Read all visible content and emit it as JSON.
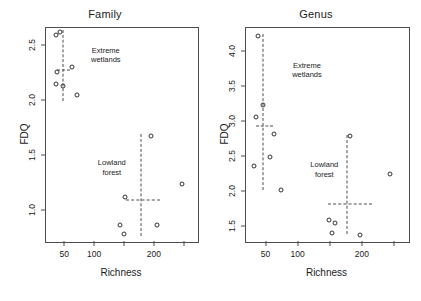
{
  "figure": {
    "width": 421,
    "height": 301,
    "background": "#ffffff",
    "point_color": "#333333",
    "line_color": "#4d4d4d",
    "text_color": "#1a1a1a"
  },
  "chart_data": [
    {
      "type": "scatter",
      "title": "Family",
      "xlabel": "Richness",
      "ylabel": "FDQ",
      "xlim": [
        18,
        272
      ],
      "ylim": [
        0.72,
        2.66
      ],
      "grid": false,
      "legend": null,
      "xticks": [
        50,
        100,
        150,
        200,
        250
      ],
      "xtick_labels": [
        "50",
        "100",
        "",
        "200",
        ""
      ],
      "yticks": [
        1.0,
        1.5,
        2.0,
        2.5
      ],
      "ytick_labels": [
        "1.0",
        "1.5",
        "2.0",
        "2.5"
      ],
      "series": [
        {
          "name": "Extreme wetlands",
          "points": [
            {
              "x": 34,
              "y": 2.6
            },
            {
              "x": 42,
              "y": 2.62
            },
            {
              "x": 36,
              "y": 2.26
            },
            {
              "x": 61,
              "y": 2.31
            },
            {
              "x": 34,
              "y": 2.15
            },
            {
              "x": 47,
              "y": 2.13
            },
            {
              "x": 70,
              "y": 2.05
            }
          ]
        },
        {
          "name": "Lowland forest",
          "points": [
            {
              "x": 193,
              "y": 1.68
            },
            {
              "x": 246,
              "y": 1.25
            },
            {
              "x": 150,
              "y": 1.13
            },
            {
              "x": 142,
              "y": 0.87
            },
            {
              "x": 148,
              "y": 0.79
            },
            {
              "x": 203,
              "y": 0.87
            }
          ]
        }
      ],
      "annotations": [
        {
          "text": "Extreme\nwetlands",
          "x": 118,
          "y": 2.5,
          "cluster": "extreme-wetlands"
        },
        {
          "text": "Lowland\nforest",
          "x": 128,
          "y": 1.48,
          "cluster": "lowland-forest"
        }
      ],
      "crosshairs": [
        {
          "cluster": "extreme-wetlands",
          "x_center": 46,
          "y_center": 2.28,
          "x_min": 36,
          "x_max": 58,
          "y_min": 2.0,
          "y_max": 2.64
        },
        {
          "cluster": "lowland-forest",
          "x_center": 176,
          "y_center": 1.1,
          "x_min": 152,
          "x_max": 208,
          "y_min": 0.77,
          "y_max": 1.7
        }
      ]
    },
    {
      "type": "scatter",
      "title": "Genus",
      "xlabel": "Richness",
      "ylabel": "FDQ",
      "xlim": [
        18,
        272
      ],
      "ylim": [
        1.28,
        4.35
      ],
      "grid": false,
      "legend": null,
      "xticks": [
        50,
        100,
        150,
        200,
        250
      ],
      "xtick_labels": [
        "50",
        "100",
        "",
        "200",
        ""
      ],
      "yticks": [
        1.5,
        2.0,
        2.5,
        3.0,
        3.5,
        4.0
      ],
      "ytick_labels": [
        "1.5",
        "2.0",
        "2.5",
        "3.0",
        "3.5",
        "4.0"
      ],
      "series": [
        {
          "name": "Extreme wetlands",
          "points": [
            {
              "x": 36,
              "y": 4.24
            },
            {
              "x": 44,
              "y": 3.25
            },
            {
              "x": 33,
              "y": 3.07
            },
            {
              "x": 62,
              "y": 2.83
            },
            {
              "x": 55,
              "y": 2.5
            },
            {
              "x": 31,
              "y": 2.37
            },
            {
              "x": 72,
              "y": 2.02
            }
          ]
        },
        {
          "name": "Lowland forest",
          "points": [
            {
              "x": 180,
              "y": 2.8
            },
            {
              "x": 243,
              "y": 2.25
            },
            {
              "x": 148,
              "y": 1.6
            },
            {
              "x": 157,
              "y": 1.55
            },
            {
              "x": 152,
              "y": 1.41
            },
            {
              "x": 196,
              "y": 1.38
            }
          ]
        }
      ],
      "annotations": [
        {
          "text": "Extreme\nwetlands",
          "x": 113,
          "y": 3.88,
          "cluster": "extreme-wetlands"
        },
        {
          "text": "Lowland\nforest",
          "x": 140,
          "y": 2.45,
          "cluster": "lowland-forest"
        }
      ],
      "crosshairs": [
        {
          "cluster": "extreme-wetlands",
          "x_center": 45,
          "y_center": 2.95,
          "x_min": 33,
          "x_max": 60,
          "y_min": 2.03,
          "y_max": 4.26
        },
        {
          "cluster": "lowland-forest",
          "x_center": 176,
          "y_center": 1.83,
          "x_min": 145,
          "x_max": 215,
          "y_min": 1.39,
          "y_max": 2.82
        }
      ]
    }
  ]
}
